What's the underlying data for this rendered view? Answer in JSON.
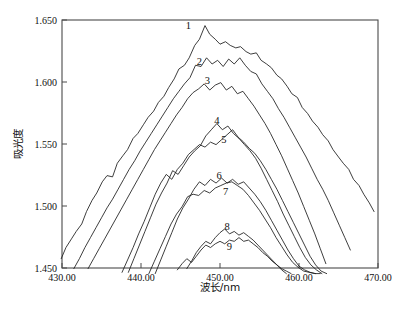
{
  "chart_data": {
    "type": "line",
    "title": "",
    "xlabel": "波长/nm",
    "ylabel": "吸光度",
    "xlim": [
      430.0,
      470.0
    ],
    "ylim": [
      1.45,
      1.65
    ],
    "grid": false,
    "legend_position": "inline-labels",
    "x_tick_labels": [
      "430.00",
      "440.00",
      "450.00",
      "460.00",
      "470.00"
    ],
    "x_ticks": [
      430.0,
      440.0,
      450.0,
      460.0,
      470.0
    ],
    "y_tick_labels": [
      "1.450",
      "1.500",
      "1.550",
      "1.600",
      "1.650"
    ],
    "y_ticks": [
      1.45,
      1.5,
      1.55,
      1.6,
      1.65
    ],
    "annotations": [
      {
        "text": "1",
        "x": 446.0,
        "y": 1.6425
      },
      {
        "text": "2",
        "x": 447.4,
        "y": 1.6135
      },
      {
        "text": "3",
        "x": 448.4,
        "y": 1.5985
      },
      {
        "text": "4",
        "x": 449.6,
        "y": 1.5665
      },
      {
        "text": "5",
        "x": 450.5,
        "y": 1.5505
      },
      {
        "text": "6",
        "x": 449.9,
        "y": 1.5215
      },
      {
        "text": "7",
        "x": 450.7,
        "y": 1.5085
      },
      {
        "text": "8",
        "x": 450.9,
        "y": 1.4805
      },
      {
        "text": "9",
        "x": 451.2,
        "y": 1.4645
      }
    ],
    "series": [
      {
        "name": "1",
        "label": "1",
        "peak_x": 447.5,
        "peak_y": 1.6455,
        "x": [
          429.9,
          430.5,
          431.2,
          431.8,
          432.5,
          433.1,
          433.8,
          434.4,
          435.1,
          435.7,
          436.4,
          437.0,
          437.7,
          438.3,
          439.0,
          439.6,
          440.3,
          440.9,
          441.6,
          442.2,
          442.9,
          443.5,
          444.2,
          444.8,
          445.5,
          446.1,
          446.8,
          447.4,
          448.1,
          448.7,
          449.4,
          450.0,
          450.7,
          451.3,
          452.0,
          452.6,
          453.3,
          453.9,
          454.6,
          455.2,
          455.9,
          456.5,
          457.2,
          457.8,
          458.5,
          459.1,
          459.8,
          460.4,
          461.1,
          461.7,
          462.4,
          463.0,
          463.7,
          464.3,
          465.0,
          465.6,
          466.3,
          466.9,
          467.6,
          468.2,
          468.9,
          469.5
        ],
        "y": [
          1.4575,
          1.4665,
          1.4735,
          1.4795,
          1.4855,
          1.4955,
          1.5045,
          1.5105,
          1.5195,
          1.5245,
          1.5235,
          1.5345,
          1.5405,
          1.5455,
          1.5545,
          1.5585,
          1.5655,
          1.5715,
          1.5765,
          1.5835,
          1.5885,
          1.5955,
          1.6025,
          1.6105,
          1.6135,
          1.6195,
          1.6295,
          1.6345,
          1.6455,
          1.6385,
          1.6345,
          1.6305,
          1.6325,
          1.6295,
          1.6275,
          1.6285,
          1.6245,
          1.6225,
          1.6235,
          1.6175,
          1.6145,
          1.6115,
          1.6055,
          1.6025,
          1.5965,
          1.5905,
          1.5875,
          1.5795,
          1.5745,
          1.5685,
          1.5635,
          1.5575,
          1.5525,
          1.5455,
          1.5395,
          1.5345,
          1.5295,
          1.5215,
          1.5165,
          1.5095,
          1.5025,
          1.4955
        ]
      },
      {
        "name": "2",
        "label": "2",
        "peak_x": 448.8,
        "peak_y": 1.6195,
        "x": [
          431.5,
          432.2,
          432.9,
          433.6,
          434.3,
          435.0,
          435.7,
          436.4,
          437.1,
          437.8,
          438.5,
          439.2,
          439.9,
          440.6,
          441.3,
          442.0,
          442.7,
          443.4,
          444.1,
          444.8,
          445.5,
          446.2,
          446.9,
          447.6,
          448.3,
          449.0,
          449.7,
          450.4,
          451.1,
          451.8,
          452.5,
          453.2,
          453.9,
          454.6,
          455.3,
          456.0,
          456.7,
          457.4,
          458.1,
          458.8,
          459.5,
          460.2,
          460.9,
          461.6,
          462.3,
          463.0,
          463.7,
          464.4,
          465.1,
          465.8,
          466.5
        ],
        "y": [
          1.4495,
          1.4575,
          1.4665,
          1.4745,
          1.4825,
          1.4905,
          1.4985,
          1.5055,
          1.5135,
          1.5215,
          1.5295,
          1.5365,
          1.5445,
          1.5515,
          1.5585,
          1.5655,
          1.5725,
          1.5795,
          1.5865,
          1.5925,
          1.5985,
          1.6035,
          1.6135,
          1.6125,
          1.6195,
          1.6145,
          1.6175,
          1.6125,
          1.6185,
          1.6145,
          1.6195,
          1.6135,
          1.6085,
          1.6065,
          1.5985,
          1.5925,
          1.5865,
          1.5785,
          1.5715,
          1.5635,
          1.5555,
          1.5475,
          1.5395,
          1.5305,
          1.5215,
          1.5135,
          1.5045,
          1.4945,
          1.4845,
          1.4745,
          1.4645
        ]
      },
      {
        "name": "3",
        "label": "3",
        "peak_x": 450.2,
        "peak_y": 1.5995,
        "x": [
          433.3,
          434.0,
          434.7,
          435.4,
          436.1,
          436.8,
          437.5,
          438.2,
          438.9,
          439.6,
          440.3,
          441.0,
          441.7,
          442.4,
          443.1,
          443.8,
          444.5,
          445.2,
          445.9,
          446.6,
          447.3,
          448.0,
          448.7,
          449.4,
          450.1,
          450.8,
          451.5,
          452.2,
          452.9,
          453.6,
          454.3,
          455.0,
          455.7,
          456.4,
          457.1,
          457.8,
          458.5,
          459.2,
          459.9,
          460.6,
          461.3,
          462.0,
          462.7,
          463.4
        ],
        "y": [
          1.4495,
          1.4575,
          1.4655,
          1.4735,
          1.4815,
          1.4895,
          1.4975,
          1.5055,
          1.5135,
          1.5215,
          1.5295,
          1.5375,
          1.5455,
          1.5525,
          1.5595,
          1.5665,
          1.5735,
          1.5795,
          1.5865,
          1.5915,
          1.5945,
          1.5985,
          1.5935,
          1.5975,
          1.5995,
          1.5935,
          1.5965,
          1.5905,
          1.5925,
          1.5865,
          1.5805,
          1.5735,
          1.5665,
          1.5585,
          1.5495,
          1.5405,
          1.5305,
          1.5205,
          1.5105,
          1.4995,
          1.4885,
          1.4775,
          1.4655,
          1.4535
        ]
      },
      {
        "name": "4",
        "label": "4",
        "peak_x": 449.6,
        "peak_y": 1.5665,
        "x": [
          438.4,
          439.1,
          439.8,
          440.5,
          441.2,
          441.9,
          442.6,
          443.3,
          444.0,
          444.7,
          445.4,
          446.1,
          446.8,
          447.5,
          448.2,
          448.9,
          449.6,
          450.3,
          451.0,
          451.7,
          452.4,
          453.1,
          453.8,
          454.5,
          455.2,
          455.9,
          456.6,
          457.3,
          458.0,
          458.7,
          459.4,
          460.1,
          460.8,
          461.5,
          462.2,
          462.9
        ],
        "y": [
          1.4465,
          1.4575,
          1.4685,
          1.4795,
          1.4905,
          1.5015,
          1.5105,
          1.5185,
          1.5285,
          1.5255,
          1.5325,
          1.5395,
          1.5445,
          1.5485,
          1.5565,
          1.5615,
          1.5665,
          1.5615,
          1.5645,
          1.5585,
          1.5545,
          1.5495,
          1.5445,
          1.5385,
          1.5305,
          1.5215,
          1.5125,
          1.5035,
          1.4935,
          1.4845,
          1.4755,
          1.4665,
          1.4585,
          1.4525,
          1.4485,
          1.4455
        ]
      },
      {
        "name": "5",
        "label": "5",
        "peak_x": 451.5,
        "peak_y": 1.5615,
        "x": [
          437.6,
          438.3,
          439.0,
          439.7,
          440.4,
          441.1,
          441.8,
          442.5,
          443.2,
          443.9,
          444.6,
          445.3,
          446.0,
          446.7,
          447.4,
          448.1,
          448.8,
          449.5,
          450.2,
          450.9,
          451.6,
          452.3,
          453.0,
          453.7,
          454.4,
          455.1,
          455.8,
          456.5,
          457.2,
          457.9,
          458.6,
          459.3,
          460.0,
          460.7,
          461.4,
          462.1,
          462.8,
          463.5
        ],
        "y": [
          1.4465,
          1.4565,
          1.4665,
          1.4775,
          1.4875,
          1.4985,
          1.5095,
          1.5185,
          1.5255,
          1.5215,
          1.5295,
          1.5345,
          1.5415,
          1.5455,
          1.5495,
          1.5475,
          1.5515,
          1.5495,
          1.5535,
          1.5575,
          1.5615,
          1.5555,
          1.5515,
          1.5465,
          1.5425,
          1.5365,
          1.5295,
          1.5215,
          1.5135,
          1.5045,
          1.4955,
          1.4865,
          1.4775,
          1.4685,
          1.4595,
          1.4525,
          1.4475,
          1.4455
        ]
      },
      {
        "name": "6",
        "label": "6",
        "peak_x": 450.6,
        "peak_y": 1.5225,
        "x": [
          441.8,
          442.5,
          443.2,
          443.9,
          444.6,
          445.3,
          446.0,
          446.7,
          447.4,
          448.1,
          448.8,
          449.5,
          450.2,
          450.9,
          451.6,
          452.3,
          453.0,
          453.7,
          454.4,
          455.1,
          455.8,
          456.5,
          457.2,
          457.9,
          458.6,
          459.3,
          460.0,
          460.7,
          461.4,
          462.1
        ],
        "y": [
          1.4455,
          1.4565,
          1.4675,
          1.4785,
          1.4895,
          1.4985,
          1.5055,
          1.5135,
          1.5195,
          1.5165,
          1.5215,
          1.5185,
          1.5225,
          1.5185,
          1.5215,
          1.5175,
          1.5195,
          1.5145,
          1.5095,
          1.5035,
          1.4965,
          1.4885,
          1.4805,
          1.4725,
          1.4645,
          1.4575,
          1.4515,
          1.4485,
          1.4465,
          1.4455
        ]
      },
      {
        "name": "7",
        "label": "7",
        "peak_x": 451.9,
        "peak_y": 1.5195,
        "x": [
          441.0,
          441.7,
          442.4,
          443.1,
          443.8,
          444.5,
          445.2,
          445.9,
          446.6,
          447.3,
          448.0,
          448.7,
          449.4,
          450.1,
          450.8,
          451.5,
          452.2,
          452.9,
          453.6,
          454.3,
          455.0,
          455.7,
          456.4,
          457.1,
          457.8,
          458.5,
          459.2,
          459.9,
          460.6,
          461.3,
          462.0,
          462.7
        ],
        "y": [
          1.4455,
          1.4555,
          1.4655,
          1.4755,
          1.4855,
          1.4935,
          1.4995,
          1.5075,
          1.5095,
          1.5085,
          1.5125,
          1.5105,
          1.5145,
          1.5165,
          1.5185,
          1.5195,
          1.5165,
          1.5135,
          1.5085,
          1.5025,
          1.4965,
          1.4895,
          1.4825,
          1.4745,
          1.4675,
          1.4605,
          1.4545,
          1.4505,
          1.4475,
          1.4465,
          1.4455,
          1.4455
        ]
      },
      {
        "name": "8",
        "label": "8",
        "peak_x": 450.8,
        "peak_y": 1.4815,
        "x": [
          445.8,
          446.4,
          447.0,
          447.6,
          448.2,
          448.8,
          449.4,
          450.0,
          450.6,
          451.2,
          451.8,
          452.4,
          453.0,
          453.6,
          454.2,
          454.8,
          455.4,
          456.0,
          456.6,
          457.2,
          457.8,
          458.4
        ],
        "y": [
          1.4495,
          1.4555,
          1.4625,
          1.4675,
          1.4715,
          1.4695,
          1.4745,
          1.4785,
          1.4815,
          1.4775,
          1.4795,
          1.4765,
          1.4785,
          1.4755,
          1.4725,
          1.4685,
          1.4645,
          1.4605,
          1.4565,
          1.4525,
          1.4485,
          1.4455
        ]
      },
      {
        "name": "9",
        "label": "9",
        "peak_x": 452.2,
        "peak_y": 1.4745,
        "x": [
          444.6,
          445.2,
          445.8,
          446.4,
          447.0,
          447.6,
          448.2,
          448.8,
          449.4,
          450.0,
          450.6,
          451.2,
          451.8,
          452.4,
          453.0,
          453.6,
          454.2,
          454.8,
          455.4,
          456.0,
          456.6,
          457.2,
          457.8,
          458.4,
          459.0
        ],
        "y": [
          1.4485,
          1.4535,
          1.4575,
          1.4545,
          1.4595,
          1.4645,
          1.4685,
          1.4665,
          1.4695,
          1.4715,
          1.4695,
          1.4725,
          1.4715,
          1.4745,
          1.4715,
          1.4725,
          1.4695,
          1.4665,
          1.4625,
          1.4595,
          1.4555,
          1.4525,
          1.4495,
          1.4475,
          1.4455
        ]
      }
    ]
  },
  "plot": {
    "frame_color": "#4a4a4a",
    "curve_color": "#1b1b1b",
    "background": "#ffffff"
  }
}
